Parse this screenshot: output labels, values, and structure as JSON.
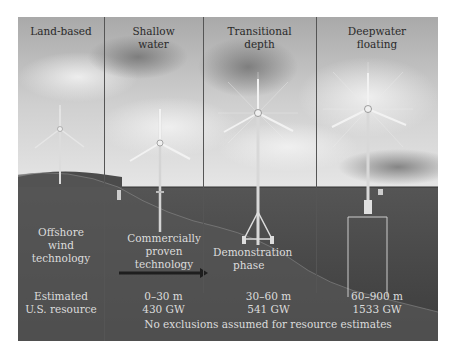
{
  "columns": [
    {
      "title": "Land-based",
      "status": "Offshore wind technology",
      "resource_label": "Estimated U.S. resource"
    },
    {
      "title": "Shallow water",
      "status": "Commercially proven technology",
      "depth": "0–30 m",
      "capacity": "430 GW"
    },
    {
      "title": "Transitional depth",
      "status": "Demonstration phase",
      "depth": "30–60 m",
      "capacity": "541 GW"
    },
    {
      "title": "Deepwater floating",
      "depth": "60–900 m",
      "capacity": "1533 GW"
    }
  ],
  "headers": {
    "col1": "Land-based",
    "col2_line1": "Shallow",
    "col2_line2": "water",
    "col3_line1": "Transitional",
    "col3_line2": "depth",
    "col4_line1": "Deepwater",
    "col4_line2": "floating"
  },
  "labels": {
    "offshore_1": "Offshore",
    "offshore_2": "wind",
    "offshore_3": "technology",
    "commercial_1": "Commercially",
    "commercial_2": "proven",
    "commercial_3": "technology",
    "demo_1": "Demonstration",
    "demo_2": "phase",
    "estimated_1": "Estimated",
    "estimated_2": "U.S. resource",
    "shallow_depth": "0–30 m",
    "shallow_gw": "430 GW",
    "transitional_depth": "30–60 m",
    "transitional_gw": "541 GW",
    "deep_depth": "60–900 m",
    "deep_gw": "1533 GW",
    "footnote": "No exclusions assumed for resource estimates"
  },
  "colors": {
    "sky": "#c4c4c4",
    "sea": "#4a4a4a",
    "seabed": "#3a3a3a",
    "arrow": "#1e1e1e"
  }
}
